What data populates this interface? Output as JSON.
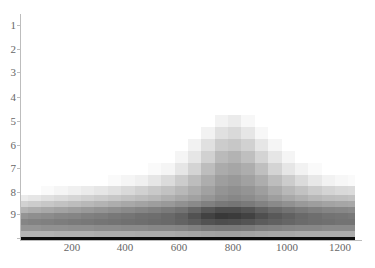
{
  "chart_data": {
    "type": "heatmap",
    "title": "",
    "xlabel": "",
    "ylabel": "",
    "colormap": "grayscale (white = low, black = high)",
    "x_ticks": [
      200,
      400,
      600,
      800,
      1000,
      1200
    ],
    "y_ticks": [
      1,
      2,
      3,
      4,
      5,
      6,
      7,
      8,
      9
    ],
    "xlim": [
      0,
      1250
    ],
    "ylim": [
      0.5,
      10
    ],
    "peak": {
      "x": 780,
      "y_top": 5
    },
    "x_columns": [
      0,
      50,
      100,
      150,
      200,
      250,
      300,
      350,
      400,
      450,
      500,
      550,
      600,
      650,
      700,
      750,
      800,
      850,
      900,
      950,
      1000,
      1050,
      1100,
      1150,
      1200,
      1250
    ],
    "y_rows": [
      5.0,
      5.5,
      6.0,
      6.5,
      7.0,
      7.5,
      8.0,
      8.25,
      8.5,
      8.75,
      9.0,
      9.25,
      9.5,
      9.75,
      10.0
    ],
    "intensity": [
      [
        0,
        0,
        0,
        0,
        0,
        0,
        0,
        0,
        0,
        0,
        0,
        0,
        0,
        0,
        0,
        0.05,
        0.08,
        0.03,
        0,
        0,
        0,
        0,
        0,
        0,
        0,
        0
      ],
      [
        0,
        0,
        0,
        0,
        0,
        0,
        0,
        0,
        0,
        0,
        0,
        0,
        0,
        0,
        0.05,
        0.12,
        0.15,
        0.1,
        0.03,
        0,
        0,
        0,
        0,
        0,
        0,
        0
      ],
      [
        0,
        0,
        0,
        0,
        0,
        0,
        0,
        0,
        0,
        0,
        0,
        0,
        0,
        0.05,
        0.12,
        0.2,
        0.22,
        0.18,
        0.1,
        0.04,
        0,
        0,
        0,
        0,
        0,
        0
      ],
      [
        0,
        0,
        0,
        0,
        0,
        0,
        0,
        0,
        0,
        0,
        0,
        0,
        0.04,
        0.1,
        0.18,
        0.27,
        0.3,
        0.25,
        0.17,
        0.1,
        0.04,
        0,
        0,
        0,
        0,
        0
      ],
      [
        0,
        0,
        0,
        0,
        0,
        0,
        0,
        0,
        0,
        0,
        0.02,
        0.04,
        0.1,
        0.17,
        0.26,
        0.33,
        0.35,
        0.32,
        0.25,
        0.17,
        0.1,
        0.05,
        0.02,
        0,
        0,
        0
      ],
      [
        0,
        0,
        0,
        0,
        0,
        0,
        0,
        0.02,
        0.04,
        0.06,
        0.1,
        0.14,
        0.2,
        0.26,
        0.32,
        0.38,
        0.4,
        0.37,
        0.32,
        0.26,
        0.2,
        0.14,
        0.09,
        0.05,
        0.03,
        0.02
      ],
      [
        0.0,
        0.0,
        0.02,
        0.04,
        0.06,
        0.08,
        0.1,
        0.12,
        0.15,
        0.18,
        0.21,
        0.24,
        0.28,
        0.32,
        0.37,
        0.42,
        0.44,
        0.42,
        0.38,
        0.33,
        0.28,
        0.24,
        0.2,
        0.17,
        0.15,
        0.14
      ],
      [
        0.08,
        0.1,
        0.12,
        0.14,
        0.16,
        0.18,
        0.2,
        0.22,
        0.24,
        0.26,
        0.28,
        0.31,
        0.34,
        0.37,
        0.41,
        0.45,
        0.47,
        0.45,
        0.42,
        0.38,
        0.34,
        0.31,
        0.28,
        0.26,
        0.25,
        0.24
      ],
      [
        0.18,
        0.2,
        0.22,
        0.24,
        0.26,
        0.28,
        0.3,
        0.32,
        0.34,
        0.36,
        0.38,
        0.4,
        0.43,
        0.46,
        0.5,
        0.53,
        0.54,
        0.52,
        0.49,
        0.46,
        0.43,
        0.4,
        0.38,
        0.36,
        0.35,
        0.34
      ],
      [
        0.3,
        0.32,
        0.34,
        0.36,
        0.38,
        0.4,
        0.42,
        0.44,
        0.46,
        0.48,
        0.5,
        0.52,
        0.55,
        0.6,
        0.66,
        0.7,
        0.7,
        0.67,
        0.62,
        0.58,
        0.55,
        0.52,
        0.5,
        0.48,
        0.47,
        0.46
      ],
      [
        0.42,
        0.44,
        0.45,
        0.47,
        0.48,
        0.5,
        0.51,
        0.53,
        0.54,
        0.56,
        0.57,
        0.59,
        0.62,
        0.68,
        0.74,
        0.78,
        0.77,
        0.74,
        0.69,
        0.65,
        0.62,
        0.59,
        0.57,
        0.55,
        0.54,
        0.53
      ],
      [
        0.48,
        0.49,
        0.5,
        0.51,
        0.52,
        0.53,
        0.54,
        0.55,
        0.56,
        0.57,
        0.58,
        0.59,
        0.61,
        0.64,
        0.68,
        0.7,
        0.69,
        0.67,
        0.64,
        0.62,
        0.6,
        0.58,
        0.57,
        0.56,
        0.55,
        0.55
      ],
      [
        0.42,
        0.42,
        0.43,
        0.43,
        0.44,
        0.44,
        0.45,
        0.45,
        0.46,
        0.46,
        0.47,
        0.47,
        0.48,
        0.5,
        0.52,
        0.53,
        0.53,
        0.52,
        0.5,
        0.49,
        0.48,
        0.47,
        0.47,
        0.46,
        0.46,
        0.46
      ],
      [
        0.3,
        0.3,
        0.3,
        0.31,
        0.31,
        0.31,
        0.32,
        0.32,
        0.32,
        0.33,
        0.33,
        0.33,
        0.34,
        0.35,
        0.36,
        0.37,
        0.37,
        0.36,
        0.35,
        0.34,
        0.34,
        0.33,
        0.33,
        0.33,
        0.33,
        0.33
      ],
      [
        0.95,
        0.95,
        0.95,
        0.95,
        0.95,
        0.95,
        0.95,
        0.95,
        0.95,
        0.95,
        0.95,
        0.95,
        0.95,
        0.95,
        0.95,
        0.95,
        0.95,
        0.95,
        0.95,
        0.95,
        0.95,
        0.95,
        0.95,
        0.95,
        0.95,
        0.95
      ]
    ]
  },
  "axes": {
    "y_labels": [
      "1",
      "2",
      "3",
      "4",
      "5",
      "6",
      "7",
      "8",
      "9"
    ],
    "x_labels": [
      "200",
      "400",
      "600",
      "800",
      "1000",
      "1200"
    ]
  }
}
